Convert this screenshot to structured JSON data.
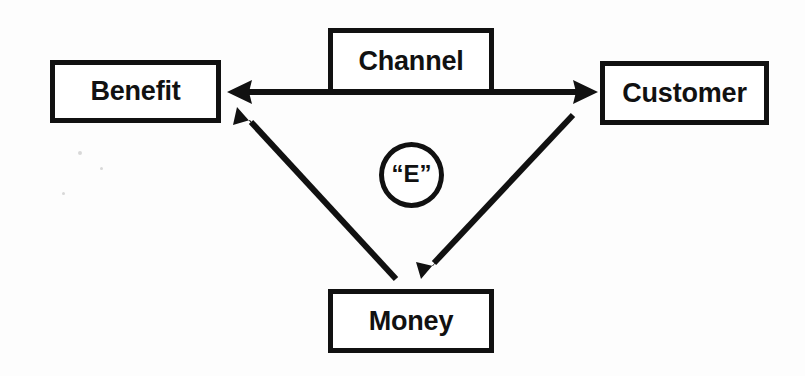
{
  "diagram": {
    "background_color": "#fdfdfd",
    "stroke_color": "#111111",
    "nodes": [
      {
        "id": "benefit",
        "label": "Benefit",
        "shape": "rectangle",
        "x": 50,
        "y": 60,
        "width": 171,
        "height": 63
      },
      {
        "id": "channel",
        "label": "Channel",
        "shape": "rectangle",
        "x": 328,
        "y": 28,
        "width": 166,
        "height": 66
      },
      {
        "id": "customer",
        "label": "Customer",
        "shape": "rectangle",
        "x": 600,
        "y": 61,
        "width": 169,
        "height": 64
      },
      {
        "id": "money",
        "label": "Money",
        "shape": "rectangle",
        "x": 328,
        "y": 289,
        "width": 166,
        "height": 64
      },
      {
        "id": "e-node",
        "label": "“E”",
        "shape": "circle",
        "x": 379,
        "y": 142,
        "width": 65,
        "height": 66
      }
    ],
    "edges": [
      {
        "id": "benefit-customer",
        "from": "benefit",
        "to": "customer",
        "arrowheads": "both",
        "orientation": "horizontal",
        "passes_behind": "channel"
      },
      {
        "id": "customer-money",
        "from": "customer",
        "to": "money",
        "arrowheads": "to",
        "orientation": "diagonal"
      },
      {
        "id": "money-benefit",
        "from": "money",
        "to": "benefit",
        "arrowheads": "to",
        "orientation": "diagonal"
      }
    ]
  }
}
